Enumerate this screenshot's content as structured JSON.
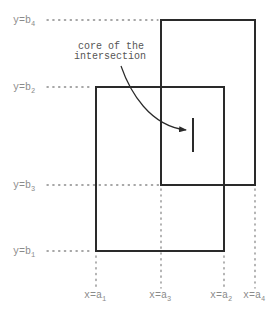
{
  "diagram": {
    "annotation": {
      "line1": "core of the",
      "line2": "intersection"
    },
    "y_labels": [
      {
        "prefix": "y=b",
        "sub": "4"
      },
      {
        "prefix": "y=b",
        "sub": "2"
      },
      {
        "prefix": "y=b",
        "sub": "3"
      },
      {
        "prefix": "y=b",
        "sub": "1"
      }
    ],
    "x_labels": [
      {
        "prefix": "x=a",
        "sub": "1"
      },
      {
        "prefix": "x=a",
        "sub": "3"
      },
      {
        "prefix": "x=a",
        "sub": "2"
      },
      {
        "prefix": "x=a",
        "sub": "4"
      }
    ],
    "rectangles": [
      {
        "name": "rectangle-1",
        "x_from": "a1",
        "x_to": "a2",
        "y_from": "b1",
        "y_to": "b2"
      },
      {
        "name": "rectangle-2",
        "x_from": "a3",
        "x_to": "a4",
        "y_from": "b3",
        "y_to": "b4"
      }
    ],
    "colors": {
      "shape": "#2a2a2a",
      "guide": "#8a8a8a"
    }
  }
}
